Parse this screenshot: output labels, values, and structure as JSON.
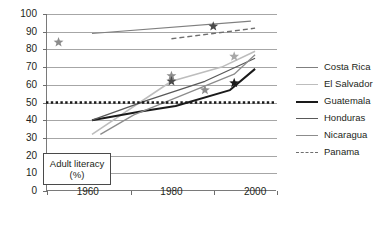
{
  "chart_data": {
    "type": "line",
    "title": "",
    "xlabel": "",
    "ylabel": "",
    "annotation": {
      "line1": "Adult literacy",
      "line2": "(%)"
    },
    "xlim": [
      1950,
      2005
    ],
    "ylim": [
      0,
      100
    ],
    "grid": true,
    "legend_position": "right",
    "ytick_labels": [
      "100",
      "90",
      "80",
      "70",
      "60",
      "50",
      "40",
      "30",
      "20",
      "10",
      "0"
    ],
    "ytick_values": [
      100,
      90,
      80,
      70,
      60,
      50,
      40,
      30,
      20,
      10,
      0
    ],
    "xtick_labels": [
      "1960",
      "1980",
      "2000"
    ],
    "xtick_values": [
      1960,
      1980,
      2000
    ],
    "reference_line": {
      "value": 50,
      "style": "dotted",
      "color": "#1a1a1a"
    },
    "series": [
      {
        "name": "Costa Rica",
        "color": "#7f7f7f",
        "width": 1.1,
        "style": "solid",
        "x": [
          1961,
          1999
        ],
        "values": [
          89,
          96
        ]
      },
      {
        "name": "El Salvador",
        "color": "#bdbdbd",
        "width": 1.6,
        "style": "solid",
        "x": [
          1961,
          1980,
          1992,
          2000
        ],
        "values": [
          32,
          62,
          70,
          79
        ]
      },
      {
        "name": "Guatemala",
        "color": "#1a1a1a",
        "width": 2.0,
        "style": "solid",
        "x": [
          1961,
          1973,
          1981,
          1994,
          2000
        ],
        "values": [
          40,
          45,
          48,
          57,
          69
        ]
      },
      {
        "name": "Honduras",
        "color": "#595959",
        "width": 1.3,
        "style": "solid",
        "x": [
          1961,
          1974,
          1988,
          2000
        ],
        "values": [
          40,
          51,
          62,
          75
        ]
      },
      {
        "name": "Nicaragua",
        "color": "#8c8c8c",
        "width": 1.3,
        "style": "solid",
        "x": [
          1963,
          1971,
          1995,
          2000
        ],
        "values": [
          32,
          43,
          66,
          77
        ]
      },
      {
        "name": "Panama",
        "color": "#6e6e6e",
        "width": 1.4,
        "style": "dashed",
        "x": [
          1980,
          1990,
          2000
        ],
        "values": [
          86,
          89,
          92
        ]
      }
    ],
    "markers": [
      {
        "series": "El Salvador",
        "x": 1953,
        "value": 84,
        "color": "#8c8c8c",
        "shape": "star"
      },
      {
        "series": "Panama",
        "x": 1990,
        "value": 93,
        "color": "#4a4a4a",
        "shape": "star"
      },
      {
        "series": "El Salvador",
        "x": 1980,
        "value": 65,
        "color": "#8c8c8c",
        "shape": "star"
      },
      {
        "series": "Honduras",
        "x": 1980,
        "value": 62,
        "color": "#4a4a4a",
        "shape": "star"
      },
      {
        "series": "El Salvador",
        "x": 1995,
        "value": 76,
        "color": "#a8a8a8",
        "shape": "star"
      },
      {
        "series": "Nicaragua",
        "x": 1988,
        "value": 57,
        "color": "#8c8c8c",
        "shape": "star"
      },
      {
        "series": "Guatemala",
        "x": 1995,
        "value": 61,
        "color": "#1a1a1a",
        "shape": "star"
      }
    ]
  },
  "legend": {
    "items": [
      {
        "label": "Costa Rica",
        "color": "#7f7f7f",
        "style": "solid",
        "width": 1.2
      },
      {
        "label": "El Salvador",
        "color": "#bdbdbd",
        "style": "solid",
        "width": 1.8
      },
      {
        "label": "Guatemala",
        "color": "#1a1a1a",
        "style": "solid",
        "width": 2.2
      },
      {
        "label": "Honduras",
        "color": "#595959",
        "style": "solid",
        "width": 1.4
      },
      {
        "label": "Nicaragua",
        "color": "#8c8c8c",
        "style": "solid",
        "width": 1.4
      },
      {
        "label": "Panama",
        "color": "#6e6e6e",
        "style": "dashed",
        "width": 1.5
      }
    ]
  }
}
